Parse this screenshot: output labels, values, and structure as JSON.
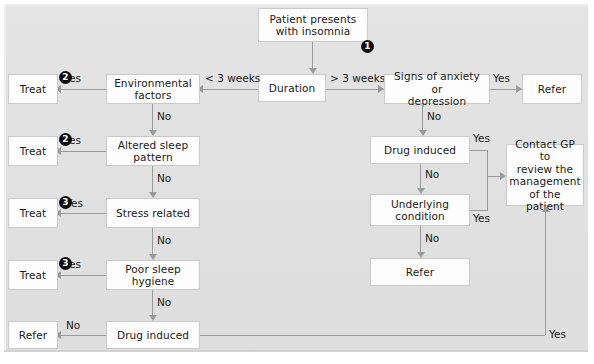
{
  "diagram": {
    "background_color": "#e2e2e2",
    "box_fill": "#fdfdfd",
    "line_color": "#9a9a9a",
    "marker_color": "#0d0d0d"
  },
  "nodes": {
    "start": "Patient presents\nwith insomnia",
    "start_line1": "Patient presents",
    "start_line2": "with insomnia",
    "duration": "Duration",
    "environmental": "Environmental",
    "environmental_2": "factors",
    "altered_sleep": "Altered sleep",
    "altered_sleep_2": "pattern",
    "stress": "Stress related",
    "poor_hygiene": "Poor sleep",
    "poor_hygiene_2": "hygiene",
    "drug_left": "Drug induced",
    "treat_1": "Treat",
    "treat_2": "Treat",
    "treat_3": "Treat",
    "treat_4": "Treat",
    "refer_left": "Refer",
    "anxiety": "Signs of anxiety or",
    "anxiety_2": "depression",
    "refer_top_right": "Refer",
    "drug_right": "Drug induced",
    "underlying": "Underlying",
    "underlying_2": "condition",
    "refer_right": "Refer",
    "contact_gp_1": "Contact GP to",
    "contact_gp_2": "review the",
    "contact_gp_3": "management",
    "contact_gp_4": "of the patient"
  },
  "markers": {
    "one": "1",
    "two_a": "2",
    "two_b": "2",
    "three_a": "3",
    "three_b": "3"
  },
  "edge_labels": {
    "lt_3_weeks": "< 3 weeks",
    "gt_3_weeks": "> 3 weeks",
    "yes_env": "Yes",
    "no_env": "No",
    "yes_altered": "Yes",
    "no_altered": "No",
    "yes_stress": "Yes",
    "no_stress": "No",
    "yes_hygiene": "Yes",
    "no_hygiene": "No",
    "no_drug_left": "No",
    "yes_anxiety": "Yes",
    "no_anxiety": "No",
    "yes_drug_right": "Yes",
    "no_drug_right": "No",
    "yes_underlying": "Yes",
    "no_underlying": "No",
    "yes_bottom": "Yes"
  }
}
